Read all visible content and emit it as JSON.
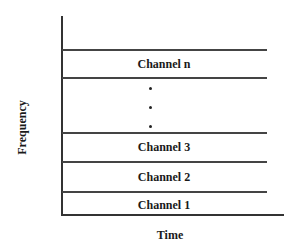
{
  "diagram": {
    "axes": {
      "x_label": "Time",
      "y_label": "Frequency"
    },
    "channels": [
      {
        "label": "Channel n"
      },
      {
        "label": "Channel 3"
      },
      {
        "label": "Channel 2"
      },
      {
        "label": "Channel 1"
      }
    ],
    "ellipsis_dots": 3,
    "line_color": "#333333"
  }
}
